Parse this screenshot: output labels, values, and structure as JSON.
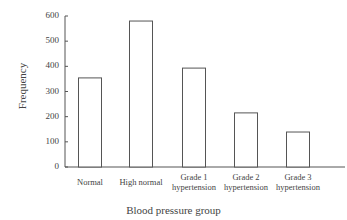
{
  "chart_data": {
    "type": "bar",
    "title": "",
    "xlabel": "Blood pressure group",
    "ylabel": "Frequency",
    "categories": [
      "Normal",
      "High normal",
      "Grade 1 hypertension",
      "Grade 2 hypertension",
      "Grade 3 hypertension"
    ],
    "category_lines": [
      [
        "Normal"
      ],
      [
        "High normal"
      ],
      [
        "Grade 1",
        "hypertension"
      ],
      [
        "Grade 2",
        "hypertension"
      ],
      [
        "Grade 3",
        "hypertension"
      ]
    ],
    "values": [
      354,
      580,
      393,
      215,
      139
    ],
    "ylim": [
      0,
      600
    ],
    "yticks": [
      0,
      100,
      200,
      300,
      400,
      500,
      600
    ],
    "grid": false,
    "legend": null,
    "bar_fill": "#ffffff",
    "bar_stroke": "#555555"
  }
}
